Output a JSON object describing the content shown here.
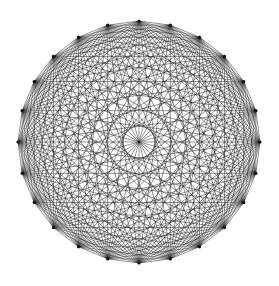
{
  "diagram": {
    "type": "complete-graph",
    "name": "K24",
    "vertex_count": 24,
    "edge_count": 276,
    "layout": "circular",
    "center": [
      139,
      142
    ],
    "radius": 121,
    "start_angle_deg": -90,
    "colors": {
      "background": "#ffffff",
      "edge": "#1a1a1a",
      "vertex": "#111111"
    }
  }
}
